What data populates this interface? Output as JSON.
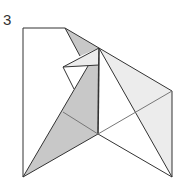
{
  "diagram": {
    "step_number": "3",
    "colors": {
      "line": "#333333",
      "dark_fill": "#c8c8c8",
      "light_fill": "#ececec",
      "paper": "#ffffff"
    }
  }
}
